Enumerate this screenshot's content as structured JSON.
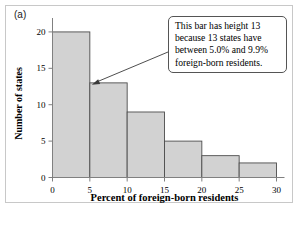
{
  "figure": {
    "panel_label": "(a)",
    "bar_fill_color": "#d2d2d2",
    "bar_edge_color": "#4d4d4d",
    "axis_color": "#808080",
    "frame_color": "#c8c8c8"
  },
  "callout": {
    "lines": [
      "This bar has height 13",
      "because 13 states have",
      "between 5.0% and 9.9%",
      "foreign-born residents."
    ]
  },
  "chart_data": {
    "type": "bar",
    "title": "",
    "xlabel": "Percent of foreign-born residents",
    "ylabel": "Number of states",
    "categories": [
      "0-5",
      "5-10",
      "10-15",
      "15-20",
      "20-25",
      "25-30"
    ],
    "bin_edges": [
      0,
      5,
      10,
      15,
      20,
      25,
      30
    ],
    "values": [
      20,
      13,
      9,
      5,
      3,
      2
    ],
    "xlim": [
      0,
      30
    ],
    "ylim": [
      0,
      21.5
    ],
    "xticks": [
      0,
      5,
      10,
      15,
      20,
      25,
      30
    ],
    "xtick_labels": [
      "0",
      "5",
      "10",
      "15",
      "20",
      "25",
      "30"
    ],
    "yticks": [
      0,
      5,
      10,
      15,
      20
    ],
    "ytick_labels": [
      "0",
      "5",
      "10",
      "15",
      "20"
    ],
    "grid": false,
    "legend": false,
    "annotations": [
      {
        "text": "This bar has height 13 because 13 states have between 5.0% and 9.9% foreign-born residents.",
        "points_to_bin": "5-10",
        "points_to_value": 13
      }
    ]
  }
}
